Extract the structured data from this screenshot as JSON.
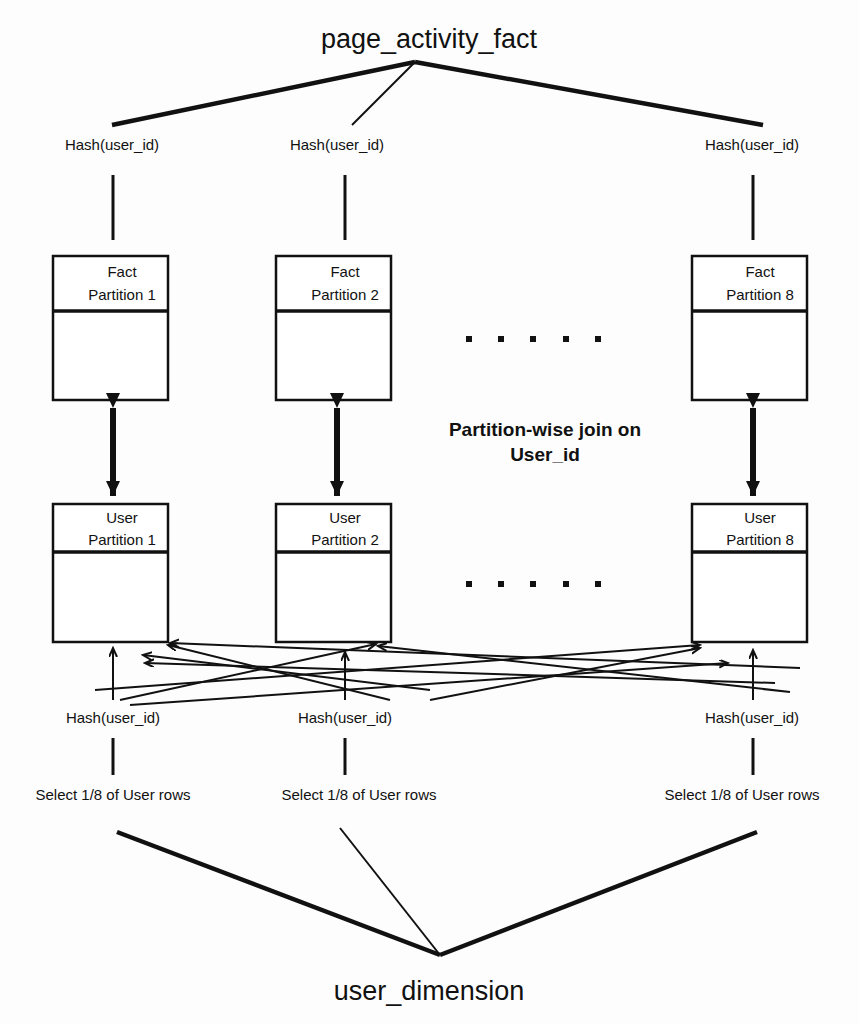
{
  "diagram": {
    "top_title": "page_activity_fact",
    "bottom_title": "user_dimension",
    "join_label_line1": "Partition-wise join on",
    "join_label_line2": "User_id",
    "hash_label": "Hash(user_id)",
    "select_label": "Select 1/8 of User rows",
    "ellipsis_glyph": ".  .  .  .  .",
    "colors": {
      "stroke": "#111111",
      "background": "#ffffff",
      "text": "#111111"
    },
    "top_hash_labels": [
      "Hash(user_id)",
      "Hash(user_id)",
      "Hash(user_id)"
    ],
    "bottom_hash_labels": [
      "Hash(user_id)",
      "Hash(user_id)",
      "Hash(user_id)"
    ],
    "select_labels": [
      "Select 1/8 of User rows",
      "Select 1/8 of User rows",
      "Select 1/8 of User rows"
    ],
    "fact_partitions": [
      {
        "line1": "Fact",
        "line2": "Partition 1"
      },
      {
        "line1": "Fact",
        "line2": "Partition 2"
      },
      {
        "line1": "Fact",
        "line2": "Partition 8"
      }
    ],
    "user_partitions": [
      {
        "line1": "User",
        "line2": "Partition 1"
      },
      {
        "line1": "User",
        "line2": "Partition 2"
      },
      {
        "line1": "User",
        "line2": "Partition 8"
      }
    ]
  }
}
